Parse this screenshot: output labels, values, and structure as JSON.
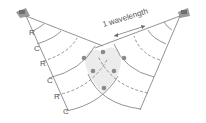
{
  "diagram": {
    "wavelength_label": "1 wavelength",
    "wave_labels": [
      "R",
      "C",
      "R",
      "C",
      "R",
      "C"
    ],
    "legend_meaning": {
      "R": "rarefaction (dashed)",
      "C": "compression (solid)"
    },
    "sources": [
      "left-speaker",
      "right-speaker"
    ],
    "colors": {
      "line": "#6b6b6b",
      "overlap_fill": "#e6e6e6",
      "node": "#8a8a8a",
      "speaker": "#9a9a9a"
    }
  }
}
